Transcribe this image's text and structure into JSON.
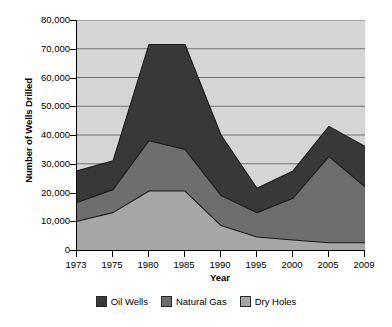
{
  "chart_data": {
    "type": "area",
    "stacked": true,
    "title": "",
    "xlabel": "Year",
    "ylabel": "Number of Wells Drilled",
    "categories": [
      "1973",
      "1975",
      "1980",
      "1985",
      "1990",
      "1995",
      "2000",
      "2005",
      "2009"
    ],
    "series": [
      {
        "name": "Dry Holes",
        "color": "#a6a6a6",
        "values": [
          10000,
          13000,
          20500,
          20500,
          8500,
          4500,
          3500,
          2500,
          2500
        ]
      },
      {
        "name": "Natural Gas",
        "color": "#6e6e6e",
        "values": [
          6500,
          8000,
          17500,
          14500,
          10500,
          8500,
          14500,
          30000,
          19500
        ]
      },
      {
        "name": "Oil Wells",
        "color": "#383838",
        "values": [
          11000,
          10000,
          33500,
          36500,
          21000,
          8500,
          9500,
          10500,
          14000
        ]
      }
    ],
    "cumulative_tops": {
      "dry_holes": [
        10000,
        13000,
        20500,
        20500,
        8500,
        4500,
        3500,
        2500,
        2500
      ],
      "natural_gas": [
        16500,
        21000,
        38000,
        35000,
        19000,
        13000,
        18000,
        32500,
        22000
      ],
      "oil_wells": [
        27500,
        31000,
        71500,
        71500,
        40000,
        21500,
        27500,
        43000,
        36000
      ]
    },
    "ylim": [
      0,
      80000
    ],
    "ytick_values": [
      0,
      10000,
      20000,
      30000,
      40000,
      50000,
      60000,
      70000,
      80000
    ],
    "ytick_labels": [
      "0",
      "10,000",
      "20,000",
      "30,000",
      "40,000",
      "50,000",
      "60,000",
      "70,000",
      "80,000"
    ],
    "grid": true,
    "grid_axis": "y",
    "legend_position": "bottom",
    "legend": [
      {
        "label": "Oil Wells",
        "color": "#383838"
      },
      {
        "label": "Natural Gas",
        "color": "#6e6e6e"
      },
      {
        "label": "Dry Holes",
        "color": "#a6a6a6"
      }
    ],
    "plot_background": "#d5d5d5",
    "figure_background": "#ffffff",
    "line_color": "#1a1a1a"
  }
}
